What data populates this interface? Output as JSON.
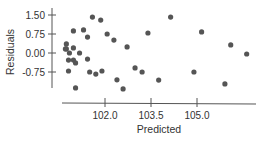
{
  "chart_data": {
    "type": "scatter",
    "title": "",
    "xlabel": "Predicted",
    "ylabel": "Residuals",
    "xlim": [
      100.3,
      106.8
    ],
    "ylim": [
      -1.4,
      1.55
    ],
    "grid": false,
    "legend": null,
    "x_ticks": [
      102.0,
      103.5,
      105.0
    ],
    "x_tick_labels": [
      "102.0",
      "103.5",
      "105.0"
    ],
    "y_ticks": [
      1.5,
      0.75,
      0.0,
      -0.75
    ],
    "y_tick_labels": [
      "1.50",
      "0.75",
      "0.00",
      "-0.75"
    ],
    "points": [
      {
        "x": 100.74,
        "y": 0.36
      },
      {
        "x": 100.74,
        "y": 0.16
      },
      {
        "x": 100.71,
        "y": 0.16
      },
      {
        "x": 100.97,
        "y": 0.2
      },
      {
        "x": 100.84,
        "y": 0.0
      },
      {
        "x": 101.17,
        "y": 0.0
      },
      {
        "x": 100.81,
        "y": -0.28
      },
      {
        "x": 100.97,
        "y": -0.28
      },
      {
        "x": 101.04,
        "y": -0.39
      },
      {
        "x": 101.43,
        "y": -0.24
      },
      {
        "x": 100.81,
        "y": -0.71
      },
      {
        "x": 101.5,
        "y": -0.75
      },
      {
        "x": 101.7,
        "y": -0.83
      },
      {
        "x": 101.9,
        "y": -0.71
      },
      {
        "x": 101.04,
        "y": -1.38
      },
      {
        "x": 102.39,
        "y": -1.06
      },
      {
        "x": 102.59,
        "y": -1.42
      },
      {
        "x": 100.97,
        "y": 0.87
      },
      {
        "x": 101.3,
        "y": 0.91
      },
      {
        "x": 101.43,
        "y": 0.63
      },
      {
        "x": 101.59,
        "y": 1.42
      },
      {
        "x": 101.86,
        "y": 1.3
      },
      {
        "x": 102.07,
        "y": 0.75
      },
      {
        "x": 102.29,
        "y": 0.51
      },
      {
        "x": 102.72,
        "y": 0.24
      },
      {
        "x": 103.4,
        "y": 0.79
      },
      {
        "x": 102.98,
        "y": -0.59
      },
      {
        "x": 103.21,
        "y": -0.75
      },
      {
        "x": 103.75,
        "y": -1.07
      },
      {
        "x": 104.14,
        "y": 1.42
      },
      {
        "x": 104.9,
        "y": -0.75
      },
      {
        "x": 105.15,
        "y": 0.83
      },
      {
        "x": 105.91,
        "y": -1.22
      },
      {
        "x": 106.1,
        "y": 0.32
      },
      {
        "x": 106.62,
        "y": -0.04
      }
    ]
  }
}
